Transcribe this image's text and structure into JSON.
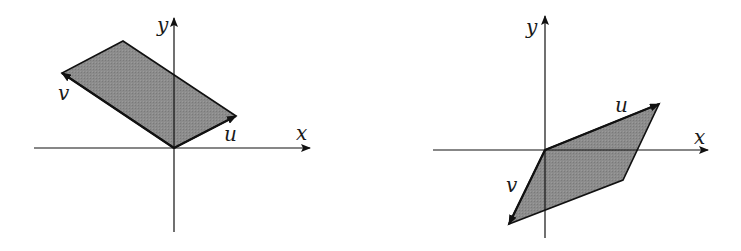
{
  "colors": {
    "fill": "#8a8a8a",
    "stroke": "#111111",
    "background": "#ffffff"
  },
  "panels": [
    {
      "name": "left",
      "origin": [
        174,
        148
      ],
      "x_axis": {
        "from": [
          34,
          148
        ],
        "to": [
          310,
          148
        ],
        "label": "x",
        "label_pos": [
          296,
          140
        ]
      },
      "y_axis": {
        "from": [
          174,
          232
        ],
        "to": [
          174,
          18
        ],
        "label": "y",
        "label_pos": [
          157,
          32
        ]
      },
      "u": {
        "tip": [
          236,
          116
        ],
        "label": "u",
        "label_pos": [
          224,
          141
        ]
      },
      "v": {
        "tip": [
          62,
          73
        ],
        "label": "v",
        "label_pos": [
          58,
          100
        ]
      },
      "fourth_vertex": [
        123,
        41
      ]
    },
    {
      "name": "right",
      "origin": [
        545,
        150
      ],
      "x_axis": {
        "from": [
          433,
          150
        ],
        "to": [
          708,
          150
        ],
        "label": "x",
        "label_pos": [
          694,
          144
        ]
      },
      "y_axis": {
        "from": [
          545,
          238
        ],
        "to": [
          545,
          16
        ],
        "label": "y",
        "label_pos": [
          526,
          34
        ]
      },
      "u": {
        "tip": [
          659,
          104
        ],
        "label": "u",
        "label_pos": [
          615,
          112
        ]
      },
      "v": {
        "tip": [
          509,
          224
        ],
        "label": "v",
        "label_pos": [
          506,
          192
        ]
      },
      "fourth_vertex": [
        623,
        180
      ]
    }
  ]
}
